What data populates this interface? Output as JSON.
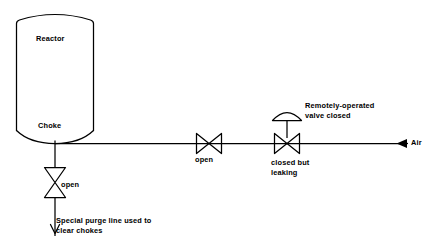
{
  "diagram": {
    "stroke_color": "#000000",
    "background_color": "#ffffff",
    "vessel": {
      "name": "reactor-vessel",
      "label": "Reactor",
      "outlet_label": "Choke"
    },
    "valves": [
      {
        "id": "purge-valve",
        "orientation": "vertical",
        "type": "bowtie-gate-valve",
        "label": "open",
        "state": "open"
      },
      {
        "id": "line-valve",
        "orientation": "horizontal",
        "type": "bowtie-gate-valve",
        "label": "open",
        "state": "open"
      },
      {
        "id": "remote-valve",
        "orientation": "horizontal",
        "type": "actuated-bowtie-valve",
        "label": "closed but\nleaking",
        "state": "closed but leaking",
        "actuator_label": "Remotely-operated\nvalve closed",
        "actuator_type": "diaphragm-dome"
      }
    ],
    "annotations": {
      "purge_note": "Special purge line used to\nclear chokes",
      "air_label": "Air"
    },
    "flows": [
      {
        "id": "air-inlet-flow",
        "label": "Air",
        "direction": "left"
      },
      {
        "id": "purge-outlet-flow",
        "label": "",
        "direction": "down"
      }
    ]
  }
}
